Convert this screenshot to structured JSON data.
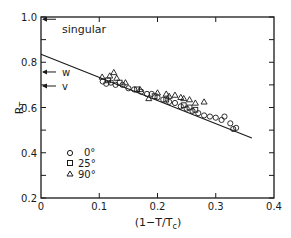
{
  "chart_data": {
    "type": "scatter",
    "title": "",
    "xlabel": "(1-T/Tc)",
    "ylabel": "RT",
    "xlim": [
      0,
      0.4
    ],
    "ylim": [
      0.2,
      1.0
    ],
    "x_ticks": [
      0,
      0.1,
      0.2,
      0.3,
      0.4
    ],
    "x_tick_labels": [
      "0",
      "0.1",
      "0.2",
      "0.3",
      "0.4"
    ],
    "y_ticks": [
      0.2,
      0.4,
      0.6,
      0.8,
      1.0
    ],
    "y_tick_labels": [
      "0.2",
      "0.4",
      "0.6",
      "0.8",
      "1.0"
    ],
    "y_minor_ticks": [
      0.3,
      0.5,
      0.7,
      0.9
    ],
    "grid": false,
    "legend_position": "lower-left inside",
    "series": [
      {
        "name": "0°",
        "marker": "circle",
        "points": [
          [
            0.106,
            0.715
          ],
          [
            0.112,
            0.705
          ],
          [
            0.12,
            0.71
          ],
          [
            0.128,
            0.7
          ],
          [
            0.14,
            0.7
          ],
          [
            0.15,
            0.685
          ],
          [
            0.16,
            0.68
          ],
          [
            0.172,
            0.67
          ],
          [
            0.182,
            0.66
          ],
          [
            0.19,
            0.66
          ],
          [
            0.2,
            0.645
          ],
          [
            0.21,
            0.635
          ],
          [
            0.22,
            0.625
          ],
          [
            0.23,
            0.62
          ],
          [
            0.24,
            0.605
          ],
          [
            0.25,
            0.595
          ],
          [
            0.26,
            0.585
          ],
          [
            0.27,
            0.575
          ],
          [
            0.28,
            0.565
          ],
          [
            0.29,
            0.56
          ],
          [
            0.3,
            0.555
          ],
          [
            0.31,
            0.545
          ],
          [
            0.315,
            0.56
          ],
          [
            0.325,
            0.53
          ],
          [
            0.335,
            0.51
          ],
          [
            0.33,
            0.505
          ]
        ]
      },
      {
        "name": "25°",
        "marker": "square",
        "points": [
          [
            0.115,
            0.72
          ],
          [
            0.135,
            0.71
          ],
          [
            0.165,
            0.68
          ],
          [
            0.195,
            0.65
          ],
          [
            0.215,
            0.635
          ],
          [
            0.245,
            0.61
          ],
          [
            0.255,
            0.6
          ],
          [
            0.265,
            0.59
          ]
        ]
      },
      {
        "name": "90°",
        "marker": "triangle",
        "points": [
          [
            0.105,
            0.735
          ],
          [
            0.118,
            0.74
          ],
          [
            0.125,
            0.755
          ],
          [
            0.13,
            0.73
          ],
          [
            0.145,
            0.71
          ],
          [
            0.17,
            0.68
          ],
          [
            0.185,
            0.64
          ],
          [
            0.2,
            0.665
          ],
          [
            0.215,
            0.66
          ],
          [
            0.22,
            0.65
          ],
          [
            0.23,
            0.655
          ],
          [
            0.24,
            0.645
          ],
          [
            0.245,
            0.64
          ],
          [
            0.255,
            0.635
          ],
          [
            0.265,
            0.62
          ],
          [
            0.28,
            0.625
          ]
        ]
      }
    ],
    "fit_line": {
      "x": [
        0,
        0.362
      ],
      "y": [
        0.835,
        0.465
      ]
    },
    "annotations": [
      {
        "text": "singular",
        "y": 0.99,
        "arrow": "left-pointing at y-axis"
      },
      {
        "text": "w",
        "y": 0.757,
        "arrow": "left-pointing at y-axis"
      },
      {
        "text": "v",
        "y": 0.695,
        "arrow": "left-pointing at y-axis"
      }
    ]
  },
  "labels": {
    "xlabel_main": "(1−T/T",
    "xlabel_sub": "c",
    "xlabel_close": ")",
    "ylabel_main": "R",
    "ylabel_sub": "T",
    "legend": [
      {
        "marker": "circle",
        "label": "0°"
      },
      {
        "marker": "square",
        "label": "25°"
      },
      {
        "marker": "triangle",
        "label": "90°"
      }
    ],
    "annot_singular": "singular",
    "annot_w": "w",
    "annot_v": "v"
  },
  "colors": {
    "ink": "#1a1a1a",
    "background": "#ffffff"
  }
}
